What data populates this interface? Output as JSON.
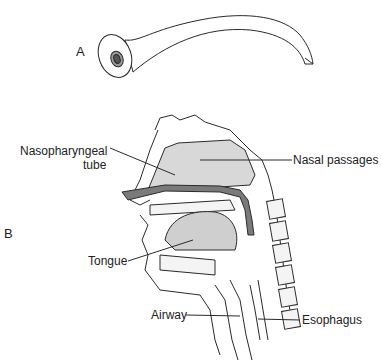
{
  "panels": {
    "a": {
      "label": "A",
      "subject": "nasopharyngeal tube (airway device)"
    },
    "b": {
      "label": "B",
      "subject": "sagittal section of head and neck with tube in place"
    }
  },
  "labels": {
    "nasopharyngeal_tube_line1": "Nasopharyngeal",
    "nasopharyngeal_tube_line2": "tube",
    "nasal_passages": "Nasal passages",
    "tongue": "Tongue",
    "airway": "Airway",
    "esophagus": "Esophagus"
  },
  "colors": {
    "line": "#2a2a2a",
    "tube_fill": "#7a7a7a",
    "cavity_fill": "#d8d8d8",
    "tongue_fill": "#cfcfcf",
    "bone_fill": "#f4f4f4"
  }
}
